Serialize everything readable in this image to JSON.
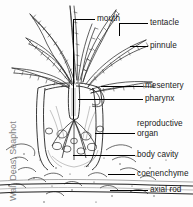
{
  "figure": {
    "watermark": "Walt Deas, Seaphot",
    "background_color": "#fdfdfd",
    "ink_color": "#1a1a1a",
    "labels": [
      {
        "id": "mouth",
        "text": "mouth"
      },
      {
        "id": "tentacle",
        "text": "tentacle"
      },
      {
        "id": "pinnule",
        "text": "pinnule"
      },
      {
        "id": "mesentery",
        "text": "mesentery"
      },
      {
        "id": "pharynx",
        "text": "pharynx"
      },
      {
        "id": "reproductive",
        "text": "reproductive"
      },
      {
        "id": "organ",
        "text": "organ"
      },
      {
        "id": "body-cavity",
        "text": "body cavity"
      },
      {
        "id": "coenenchyme",
        "text": "coenenchyme"
      },
      {
        "id": "axial-rod",
        "text": "axial rod"
      }
    ]
  }
}
